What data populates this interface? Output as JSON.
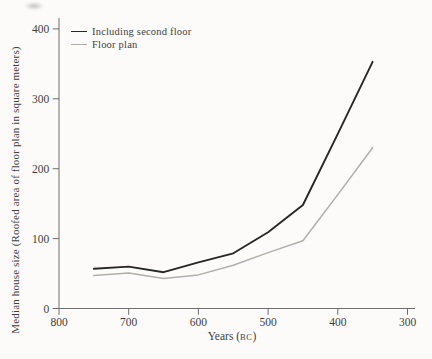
{
  "page": {
    "background": "#fcfbfa"
  },
  "chart_data": {
    "type": "line",
    "title": "",
    "ylabel": "Median house size (Roofed area of floor plan in square meters)",
    "xlabel": "Years (BC)",
    "xlabel_parts": {
      "pre": "Years (",
      "smallcaps": "BC",
      "post": ")"
    },
    "x": [
      750,
      700,
      650,
      600,
      550,
      500,
      450,
      400,
      350
    ],
    "x_ticks": [
      800,
      700,
      600,
      500,
      400,
      300
    ],
    "y_ticks": [
      0,
      100,
      200,
      300,
      400
    ],
    "xlim": [
      800,
      300
    ],
    "ylim": [
      0,
      400
    ],
    "x_reversed": true,
    "grid": false,
    "legend_position": "top-left",
    "axis_color": "#6e6e6e",
    "series": [
      {
        "name": "Including second floor",
        "color": "#272727",
        "width": 1.9,
        "values": [
          57,
          60,
          52,
          66,
          79,
          109,
          148,
          250,
          353
        ]
      },
      {
        "name": "Floor plan",
        "color": "#b2afaa",
        "width": 1.5,
        "values": [
          47,
          51,
          43,
          48,
          62,
          80,
          97,
          163,
          230
        ]
      }
    ]
  }
}
